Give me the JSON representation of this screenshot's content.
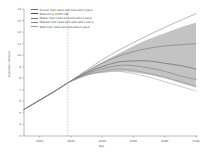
{
  "chart_data": {
    "type": "line",
    "title": "",
    "xlabel": "Year",
    "ylabel": "Population (billions)",
    "xlim": [
      1990,
      2100
    ],
    "ylim": [
      3,
      14
    ],
    "xticks": [
      "2000",
      "2020",
      "2040",
      "2060",
      "2080",
      "2100"
    ],
    "xtick_values": [
      2000,
      2020,
      2040,
      2060,
      2080,
      2100
    ],
    "yticks": [
      "3",
      "4",
      "5",
      "6",
      "7",
      "8",
      "9",
      "10",
      "11",
      "12",
      "13",
      "14"
    ],
    "ytick_values": [
      3,
      4,
      5,
      6,
      7,
      8,
      9,
      10,
      11,
      12,
      13,
      14
    ],
    "grid": false,
    "legend_position": "upper left",
    "annotations": [
      {
        "name": "reference-year-line",
        "type": "vline",
        "x": 2018,
        "style": "dashed"
      }
    ],
    "uncertainty_band": {
      "name": "projection-uncertainty-range",
      "fill": "#b8b8b8",
      "x": [
        2018,
        2030,
        2040,
        2050,
        2060,
        2070,
        2080,
        2090,
        2100
      ],
      "upper": [
        7.6,
        8.6,
        9.4,
        10.1,
        10.8,
        11.4,
        11.9,
        12.4,
        12.8
      ],
      "lower": [
        7.6,
        8.2,
        8.5,
        8.6,
        8.5,
        8.3,
        8.0,
        7.6,
        7.2
      ]
    },
    "series": [
      {
        "name": "Slower met need and education pace",
        "color": "#6e6e6e",
        "x": [
          1990,
          2000,
          2010,
          2018,
          2030,
          2040,
          2050,
          2060,
          2070,
          2080,
          2090,
          2100
        ],
        "values": [
          5.3,
          6.1,
          6.9,
          7.6,
          8.6,
          9.3,
          9.9,
          10.3,
          10.6,
          10.8,
          10.9,
          11.0
        ]
      },
      {
        "name": "Reference (SSP2-18)",
        "color": "#4f4f4f",
        "x": [
          1990,
          2000,
          2010,
          2018,
          2030,
          2040,
          2050,
          2060,
          2070,
          2080,
          2090,
          2100
        ],
        "values": [
          5.3,
          6.1,
          6.9,
          7.6,
          8.5,
          9.0,
          9.4,
          9.5,
          9.5,
          9.3,
          9.1,
          8.8
        ]
      },
      {
        "name": "Faster met need and education pace",
        "color": "#737373",
        "x": [
          1990,
          2000,
          2010,
          2018,
          2030,
          2040,
          2050,
          2060,
          2070,
          2080,
          2090,
          2100
        ],
        "values": [
          5.3,
          6.1,
          6.9,
          7.6,
          8.4,
          8.8,
          9.1,
          9.1,
          8.9,
          8.6,
          8.2,
          7.9
        ]
      },
      {
        "name": "Fastest met need and education pace",
        "color": "#8a8a8a",
        "x": [
          1990,
          2000,
          2010,
          2018,
          2030,
          2040,
          2050,
          2060,
          2070,
          2080,
          2090,
          2100
        ],
        "values": [
          5.3,
          6.1,
          6.9,
          7.6,
          8.3,
          8.6,
          8.8,
          8.7,
          8.4,
          8.1,
          7.7,
          7.3
        ]
      },
      {
        "name": "SDG met need and education pace",
        "color": "#9d9d9d",
        "x": [
          1990,
          2000,
          2010,
          2018,
          2030,
          2040,
          2050,
          2060,
          2070,
          2080,
          2090,
          2100
        ],
        "values": [
          5.3,
          6.1,
          6.9,
          7.6,
          8.3,
          8.5,
          8.6,
          8.4,
          8.1,
          7.7,
          7.3,
          6.9
        ]
      },
      {
        "name": "Upper envelope trend",
        "color": "#7a7a7a",
        "x": [
          1990,
          2018,
          2040,
          2060,
          2080,
          2100
        ],
        "values": [
          5.3,
          7.6,
          9.6,
          11.1,
          12.4,
          13.6
        ]
      }
    ]
  },
  "legend": {
    "items": [
      {
        "label": "Slower met need and education pace",
        "color": "#6e6e6e"
      },
      {
        "label": "Reference (SSP2-18)",
        "color": "#4f4f4f"
      },
      {
        "label": "Faster met need and education pace",
        "color": "#737373"
      },
      {
        "label": "Fastest met need and education pace",
        "color": "#8a8a8a"
      },
      {
        "label": "SDG met need and education pace",
        "color": "#9d9d9d"
      }
    ]
  },
  "axes": {
    "x_label": "Year",
    "y_label": "Population (billions)"
  }
}
